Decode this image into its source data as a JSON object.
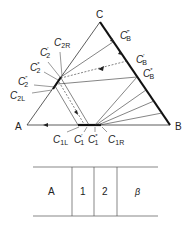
{
  "diagram": {
    "vertices": {
      "A": "A",
      "B": "B",
      "C": "C"
    },
    "labels": {
      "cb3": {
        "base": "C",
        "sub": "B",
        "sup": "‴"
      },
      "cb1": {
        "base": "C",
        "sub": "B",
        "sup": "′"
      },
      "cbs": {
        "base": "C",
        "sub": "B",
        "sup": "*"
      },
      "c2r": {
        "base": "C",
        "sub": "2R",
        "sup": ""
      },
      "c21": {
        "base": "C",
        "sub": "2",
        "sup": "′"
      },
      "c2s": {
        "base": "C",
        "sub": "2",
        "sup": "*"
      },
      "c22": {
        "base": "C",
        "sub": "2",
        "sup": "″"
      },
      "c2l": {
        "base": "C",
        "sub": "2L",
        "sup": ""
      },
      "c1l": {
        "base": "C",
        "sub": "1L",
        "sup": ""
      },
      "c11": {
        "base": "C",
        "sub": "1",
        "sup": "′"
      },
      "c1s": {
        "base": "C",
        "sub": "1",
        "sup": "*"
      },
      "c1r": {
        "base": "C",
        "sub": "1R",
        "sup": ""
      }
    },
    "layers": [
      "A",
      "1",
      "2",
      "β"
    ]
  }
}
